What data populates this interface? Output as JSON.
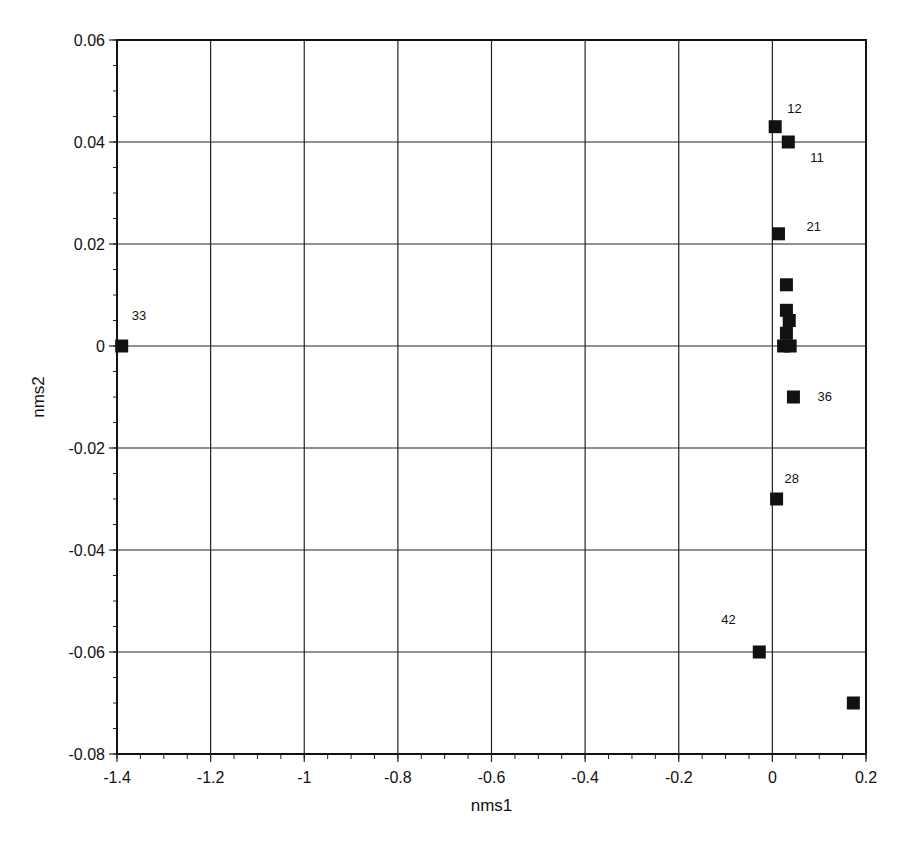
{
  "chart_data": {
    "type": "scatter",
    "title": "",
    "xlabel": "nms1",
    "ylabel": "nms2",
    "xlim": [
      -1.4,
      0.2
    ],
    "ylim": [
      -0.08,
      0.06
    ],
    "grid": true,
    "legend": null,
    "x_ticks": [
      -1.4,
      -1.2,
      -1,
      -0.8,
      -0.6,
      -0.4,
      -0.2,
      0,
      0.2
    ],
    "x_tick_labels": [
      "-1.4",
      "-1.2",
      "-1",
      "-0.8",
      "-0.6",
      "-0.4",
      "-0.2",
      "0",
      "0.2"
    ],
    "y_ticks": [
      0.06,
      0.04,
      0.02,
      0,
      -0.02,
      -0.04,
      -0.06,
      -0.08
    ],
    "y_tick_labels": [
      "0.06",
      "0.04",
      "0.02",
      "0",
      "-0.02",
      "-0.04",
      "-0.06",
      "-0.08"
    ],
    "marker": "square",
    "marker_color": "#111111",
    "points": [
      {
        "x": -1.39,
        "y": 0.0,
        "label": "33",
        "label_dx": 10,
        "label_dy": -26
      },
      {
        "x": 0.006,
        "y": 0.043,
        "label": "12",
        "label_dx": 12,
        "label_dy": -14
      },
      {
        "x": 0.034,
        "y": 0.04,
        "label": "11",
        "label_dx": 22,
        "label_dy": 20
      },
      {
        "x": 0.013,
        "y": 0.022,
        "label": "21",
        "label_dx": 28,
        "label_dy": -3
      },
      {
        "x": 0.03,
        "y": 0.012,
        "label": ""
      },
      {
        "x": 0.03,
        "y": 0.007,
        "label": ""
      },
      {
        "x": 0.036,
        "y": 0.005,
        "label": ""
      },
      {
        "x": 0.03,
        "y": 0.0025,
        "label": ""
      },
      {
        "x": 0.024,
        "y": 0.0,
        "label": ""
      },
      {
        "x": 0.038,
        "y": 0.0,
        "label": ""
      },
      {
        "x": 0.045,
        "y": -0.01,
        "label": "36",
        "label_dx": 24,
        "label_dy": 4
      },
      {
        "x": 0.009,
        "y": -0.03,
        "label": "28",
        "label_dx": 8,
        "label_dy": -16
      },
      {
        "x": -0.028,
        "y": -0.06,
        "label": "42",
        "label_dx": -38,
        "label_dy": -28
      },
      {
        "x": 0.173,
        "y": -0.07,
        "label": ""
      }
    ]
  }
}
